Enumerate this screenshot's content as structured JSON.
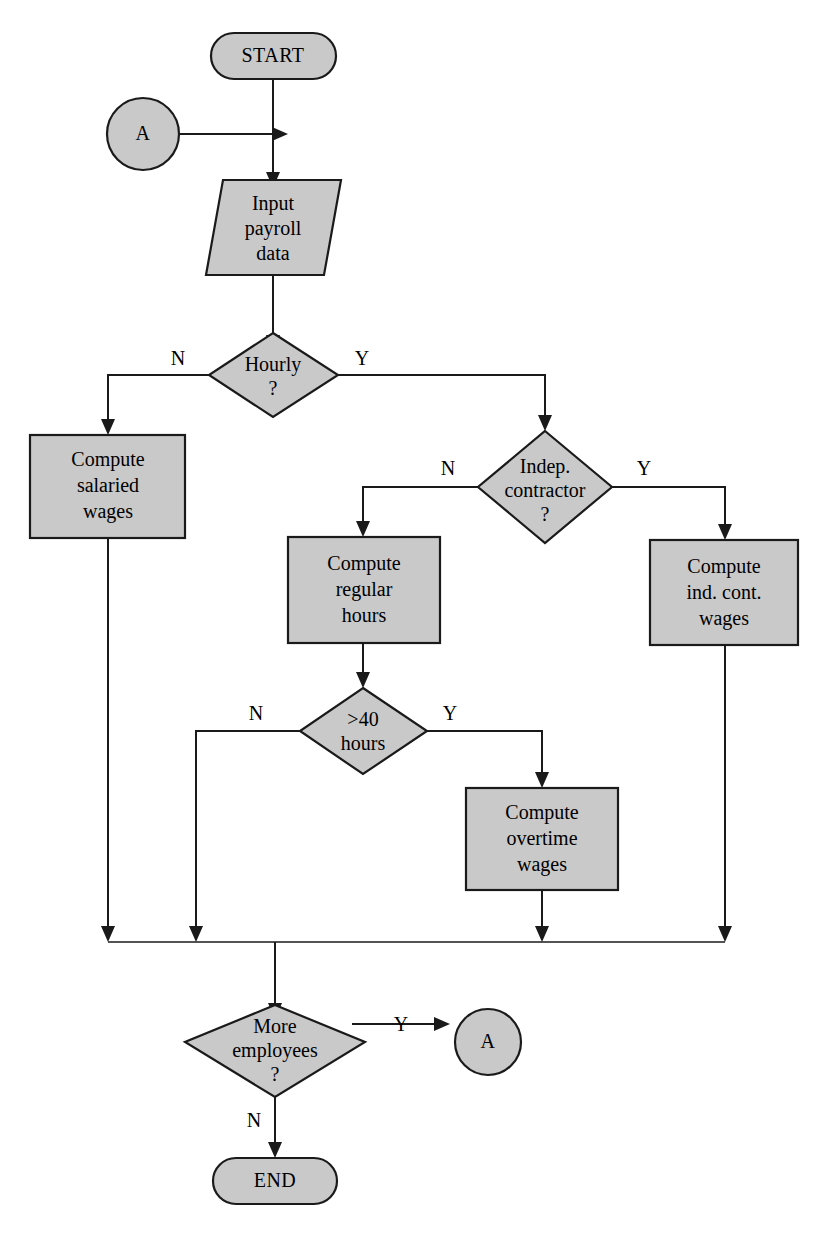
{
  "diagram": {
    "type": "flowchart",
    "fill_color": "#c9c9c9",
    "line_color": "#1a1a1a",
    "background_color": "#ffffff"
  },
  "nodes": {
    "start": {
      "label": "START",
      "shape": "terminal"
    },
    "connector_in": {
      "label": "A",
      "shape": "connector"
    },
    "input_payroll": {
      "line1": "Input",
      "line2": "payroll",
      "line3": "data",
      "shape": "input-output"
    },
    "hourly_decision": {
      "line1": "Hourly",
      "line2": "?",
      "shape": "decision"
    },
    "salaried": {
      "line1": "Compute",
      "line2": "salaried",
      "line3": "wages",
      "shape": "process"
    },
    "indep_decision": {
      "line1": "Indep.",
      "line2": "contractor",
      "line3": "?",
      "shape": "decision"
    },
    "regular_hours": {
      "line1": "Compute",
      "line2": "regular",
      "line3": "hours",
      "shape": "process"
    },
    "ind_cont_wages": {
      "line1": "Compute",
      "line2": "ind. cont.",
      "line3": "wages",
      "shape": "process"
    },
    "over40_decision": {
      "line1": ">40",
      "line2": "hours",
      "shape": "decision"
    },
    "overtime": {
      "line1": "Compute",
      "line2": "overtime",
      "line3": "wages",
      "shape": "process"
    },
    "more_employees_decision": {
      "line1": "More",
      "line2": "employees",
      "line3": "?",
      "shape": "decision"
    },
    "connector_out": {
      "label": "A",
      "shape": "connector"
    },
    "end": {
      "label": "END",
      "shape": "terminal"
    }
  },
  "branch_labels": {
    "hourly_no": "N",
    "hourly_yes": "Y",
    "indep_no": "N",
    "indep_yes": "Y",
    "over40_no": "N",
    "over40_yes": "Y",
    "more_yes": "Y",
    "more_no": "N"
  }
}
